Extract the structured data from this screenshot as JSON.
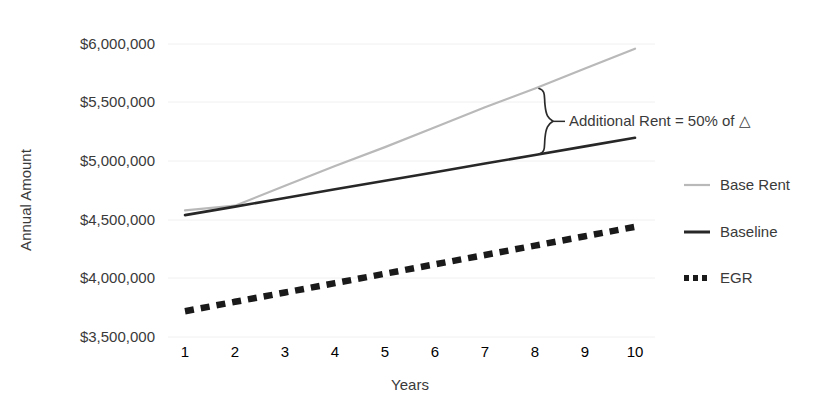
{
  "chart_data": {
    "type": "line",
    "title": "",
    "xlabel": "Years",
    "ylabel": "Annual Amount",
    "x": [
      1,
      2,
      3,
      4,
      5,
      6,
      7,
      8,
      9,
      10
    ],
    "xtick_labels": [
      "1",
      "2",
      "3",
      "4",
      "5",
      "6",
      "7",
      "8",
      "9",
      "10"
    ],
    "ytick_labels": [
      "$6,000,000",
      "$5,500,000",
      "$5,000,000",
      "$4,500,000",
      "$4,000,000",
      "$3,500,000"
    ],
    "ytick_values": [
      6000000,
      5500000,
      5000000,
      4500000,
      4000000,
      3500000
    ],
    "ylim": [
      3400000,
      6050000
    ],
    "xlim": [
      0.8,
      10.4
    ],
    "grid": true,
    "legend_position": "right",
    "series": [
      {
        "name": "Base Rent",
        "style": "solid-light",
        "color": "#b9b9b9",
        "values": [
          4580000,
          4620000,
          4790000,
          4960000,
          5120000,
          5290000,
          5460000,
          5620000,
          5790000,
          5960000
        ]
      },
      {
        "name": "Baseline",
        "style": "solid-dark",
        "color": "#272727",
        "values": [
          4540000,
          4613000,
          4686000,
          4760000,
          4833000,
          4906000,
          4980000,
          5053000,
          5126000,
          5200000
        ]
      },
      {
        "name": "EGR",
        "style": "dotted-dark",
        "color": "#1a1a1a",
        "values": [
          3720000,
          3800000,
          3880000,
          3960000,
          4040000,
          4120000,
          4200000,
          4280000,
          4360000,
          4440000
        ]
      }
    ],
    "annotations": [
      {
        "name": "additional-rent-note",
        "text": "Additional Rent = 50% of △",
        "brace_span_years": [
          8.2,
          8.2
        ],
        "brace_top_value": 5620000,
        "brace_bottom_value": 5060000
      }
    ]
  },
  "legend": {
    "items": [
      {
        "label": "Base Rent",
        "swatch": "line-light"
      },
      {
        "label": "Baseline",
        "swatch": "line-dark"
      },
      {
        "label": "EGR",
        "swatch": "line-dotted"
      }
    ]
  },
  "axes": {
    "y_title": "Annual Amount",
    "x_title": "Years"
  }
}
